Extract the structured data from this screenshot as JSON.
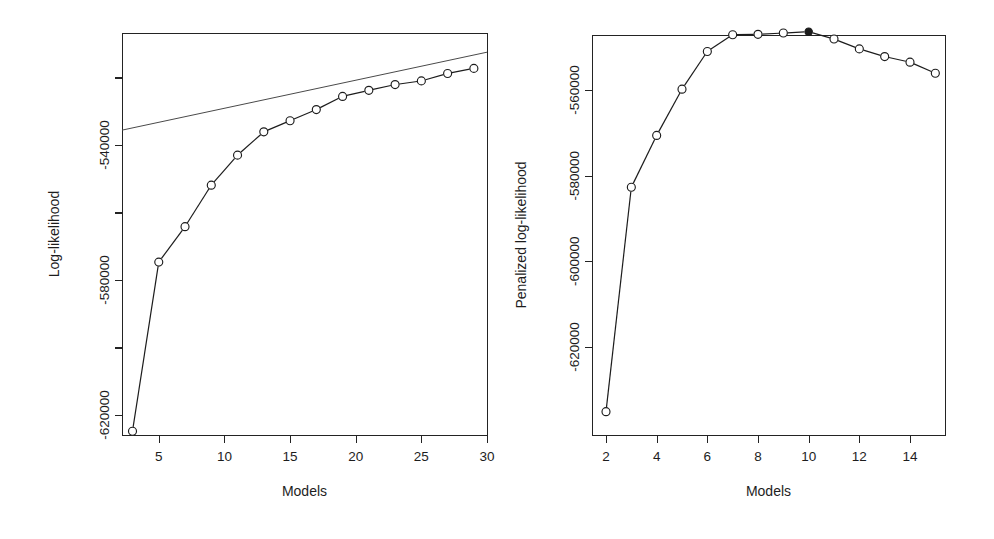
{
  "figure": {
    "background_color": "#ffffff",
    "foreground_color": "#1c1c1c",
    "panel_count": 2
  },
  "chart_data": [
    {
      "id": "left-panel",
      "type": "line",
      "title": "",
      "subtitle": "",
      "xlabel": "Models",
      "ylabel": "Log-likelihood",
      "grid": false,
      "legend": "none",
      "xlim": [
        2.2,
        30.0
      ],
      "ylim": [
        -630500,
        -513000
      ],
      "xticks": [
        5,
        10,
        15,
        20,
        25,
        30
      ],
      "xtick_labels": [
        "5",
        "10",
        "15",
        "20",
        "25",
        "30"
      ],
      "yticks": [
        -620000,
        -600000,
        -580000,
        -560000,
        -540000,
        -520000
      ],
      "ytick_labels": [
        "-620000",
        "",
        "-580000",
        "",
        "-540000",
        ""
      ],
      "ytick_labels_shown": [
        "-540000",
        "-580000",
        "-620000"
      ],
      "series": [
        {
          "name": "Log-likelihood",
          "marker": "open-circle",
          "linestyle": "solid-to-dashed",
          "x": [
            3,
            5,
            7,
            9,
            11,
            13,
            15,
            17,
            19,
            21,
            23,
            25,
            27,
            29
          ],
          "y": [
            -624800,
            -574700,
            -564200,
            -551900,
            -543000,
            -536100,
            -532800,
            -529500,
            -525600,
            -523800,
            -522100,
            -521000,
            -518800,
            -517300
          ]
        },
        {
          "name": "reference-line",
          "marker": "none",
          "linestyle": "solid",
          "x": [
            2.2,
            30.0
          ],
          "y": [
            -535600,
            -512500
          ]
        }
      ],
      "annotations": []
    },
    {
      "id": "right-panel",
      "type": "line",
      "title": "",
      "subtitle": "",
      "xlabel": "Models",
      "ylabel": "Penalized log-likelihood",
      "grid": false,
      "legend": "none",
      "xlim": [
        1.55,
        15.4
      ],
      "ylim": [
        -639500,
        -547000
      ],
      "xticks": [
        2,
        4,
        6,
        8,
        10,
        12,
        14
      ],
      "xtick_labels": [
        "2",
        "4",
        "6",
        "8",
        "10",
        "12",
        "14"
      ],
      "yticks": [
        -620000,
        -600000,
        -580000,
        -560000
      ],
      "ytick_labels": [
        "-620000",
        "-600000",
        "-580000",
        "-560000"
      ],
      "ytick_labels_shown": [
        "-560000",
        "-600000",
        "-620000"
      ],
      "series": [
        {
          "name": "Penalized log-likelihood",
          "marker": "open-circle",
          "linestyle": "solid-to-dashed",
          "x": [
            2,
            3,
            4,
            5,
            6,
            7,
            8,
            9,
            10,
            11,
            12,
            13,
            14,
            15
          ],
          "y": [
            -635100,
            -582700,
            -570600,
            -559800,
            -551000,
            -547100,
            -547000,
            -546700,
            -546400,
            -548100,
            -550400,
            -552200,
            -553500,
            -556100
          ]
        }
      ],
      "annotations": [
        {
          "kind": "selected-point",
          "x": 10,
          "y": -546400,
          "marker": "filled-circle",
          "label": "selected model"
        }
      ]
    }
  ]
}
